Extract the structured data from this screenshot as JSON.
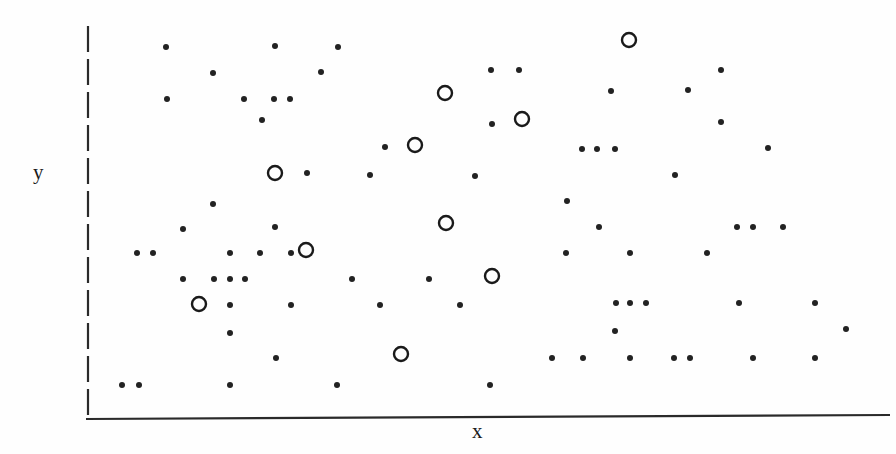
{
  "chart_data": {
    "type": "scatter",
    "title": "",
    "subtitle": "",
    "xlabel": "x",
    "ylabel": "y",
    "xlim": [
      0,
      100
    ],
    "ylim": [
      0,
      100
    ],
    "grid": false,
    "legend": null,
    "axes": {
      "x_axis_style": "solid",
      "y_axis_style": "dashed",
      "x_axis_ticks": [],
      "y_axis_ticks": [],
      "x_axis_color": "#2a2a2a",
      "y_axis_color": "#2a2a2a",
      "x_axis_pixels": {
        "x1": 86,
        "y1": 419,
        "x2": 890,
        "y2": 415
      },
      "y_axis_pixels": {
        "x": 88,
        "y1": 26,
        "y2": 420
      }
    },
    "series": [
      {
        "name": "small-dots",
        "marker": "filled-circle",
        "marker_radius_px": 3,
        "color": "#222222",
        "count": 104,
        "points_px": [
          [
            166,
            47
          ],
          [
            275,
            46
          ],
          [
            338,
            47
          ],
          [
            491,
            70
          ],
          [
            519,
            70
          ],
          [
            721,
            70
          ],
          [
            213,
            73
          ],
          [
            321,
            72
          ],
          [
            611,
            91
          ],
          [
            688,
            90
          ],
          [
            167,
            99
          ],
          [
            244,
            99
          ],
          [
            274,
            99
          ],
          [
            290,
            99
          ],
          [
            262,
            120
          ],
          [
            492,
            124
          ],
          [
            721,
            122
          ],
          [
            385,
            147
          ],
          [
            582,
            149
          ],
          [
            597,
            149
          ],
          [
            615,
            149
          ],
          [
            768,
            148
          ],
          [
            307,
            173
          ],
          [
            370,
            175
          ],
          [
            475,
            176
          ],
          [
            675,
            175
          ],
          [
            213,
            204
          ],
          [
            567,
            201
          ],
          [
            183,
            229
          ],
          [
            275,
            227
          ],
          [
            599,
            227
          ],
          [
            737,
            227
          ],
          [
            753,
            227
          ],
          [
            783,
            227
          ],
          [
            137,
            253
          ],
          [
            153,
            253
          ],
          [
            230,
            253
          ],
          [
            260,
            253
          ],
          [
            291,
            253
          ],
          [
            566,
            253
          ],
          [
            630,
            253
          ],
          [
            707,
            253
          ],
          [
            183,
            279
          ],
          [
            214,
            279
          ],
          [
            230,
            279
          ],
          [
            245,
            279
          ],
          [
            352,
            279
          ],
          [
            429,
            279
          ],
          [
            616,
            303
          ],
          [
            630,
            303
          ],
          [
            646,
            303
          ],
          [
            739,
            303
          ],
          [
            815,
            303
          ],
          [
            230,
            305
          ],
          [
            291,
            305
          ],
          [
            380,
            305
          ],
          [
            460,
            305
          ],
          [
            615,
            331
          ],
          [
            846,
            329
          ],
          [
            230,
            333
          ],
          [
            276,
            358
          ],
          [
            552,
            358
          ],
          [
            583,
            358
          ],
          [
            630,
            358
          ],
          [
            674,
            358
          ],
          [
            690,
            358
          ],
          [
            753,
            358
          ],
          [
            815,
            358
          ],
          [
            122,
            385
          ],
          [
            139,
            385
          ],
          [
            230,
            385
          ],
          [
            337,
            385
          ],
          [
            490,
            385
          ]
        ]
      },
      {
        "name": "open-circles",
        "marker": "open-circle",
        "marker_radius_px": 7,
        "color": "#1a1a1a",
        "count": 10,
        "points_px": [
          [
            629,
            40
          ],
          [
            445,
            93
          ],
          [
            522,
            119
          ],
          [
            415,
            145
          ],
          [
            275,
            173
          ],
          [
            446,
            223
          ],
          [
            306,
            250
          ],
          [
            492,
            276
          ],
          [
            199,
            304
          ],
          [
            401,
            354
          ]
        ]
      }
    ]
  },
  "labels": {
    "y": "y",
    "x": "x"
  },
  "colors": {
    "background": "#fefefe",
    "ink": "#1a1a1a",
    "marker": "#222222"
  }
}
